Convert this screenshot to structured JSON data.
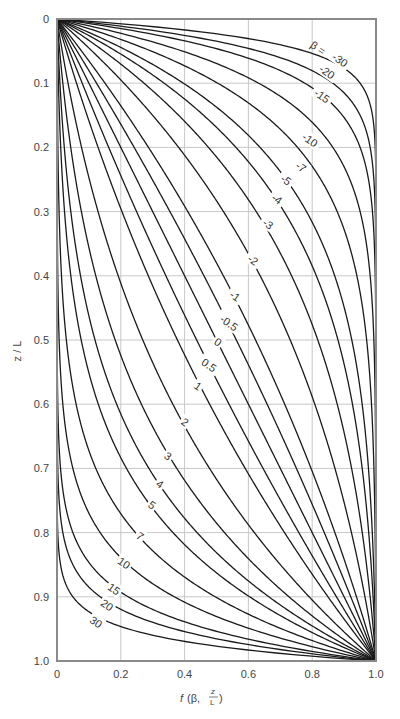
{
  "chart_data": {
    "type": "line",
    "title": "",
    "xlabel": "f (β, z/L)",
    "ylabel": "z / L",
    "xlim": [
      0,
      1.0
    ],
    "ylim": [
      1.0,
      0
    ],
    "y_inverted": true,
    "grid": true,
    "legend": "inline curve labels",
    "x_ticks": [
      "0",
      "0.2",
      "0.4",
      "0.6",
      "0.8",
      "1.0"
    ],
    "y_ticks": [
      "0",
      "0.1",
      "0.2",
      "0.3",
      "0.4",
      "0.5",
      "0.6",
      "0.7",
      "0.8",
      "0.9",
      "1.0"
    ],
    "curve_family": "f = (exp(β·z/L) − 1) / (exp(β) − 1)",
    "label_prefix": "β = ",
    "series": [
      {
        "name": "-30",
        "beta": -30,
        "label_pos": [
          340,
          60
        ]
      },
      {
        "name": "-20",
        "beta": -20,
        "label_pos": [
          327,
          72
        ]
      },
      {
        "name": "-15",
        "beta": -15,
        "label_pos": [
          322,
          96
        ]
      },
      {
        "name": "-10",
        "beta": -10,
        "label_pos": [
          310,
          140
        ]
      },
      {
        "name": "-7",
        "beta": -7,
        "label_pos": [
          301,
          167
        ]
      },
      {
        "name": "-5",
        "beta": -5,
        "label_pos": [
          286,
          180
        ]
      },
      {
        "name": "-4",
        "beta": -4,
        "label_pos": [
          277,
          199
        ]
      },
      {
        "name": "-3",
        "beta": -3,
        "label_pos": [
          268,
          224
        ]
      },
      {
        "name": "-2",
        "beta": -2,
        "label_pos": [
          253,
          260
        ]
      },
      {
        "name": "-1",
        "beta": -1,
        "label_pos": [
          235,
          296
        ]
      },
      {
        "name": "-0.5",
        "beta": -0.5,
        "label_pos": [
          229,
          323
        ]
      },
      {
        "name": "0",
        "beta": 0,
        "label_pos": [
          218,
          342
        ]
      },
      {
        "name": "0.5",
        "beta": 0.5,
        "label_pos": [
          209,
          365
        ]
      },
      {
        "name": "1",
        "beta": 1,
        "label_pos": [
          198,
          386
        ]
      },
      {
        "name": "2",
        "beta": 2,
        "label_pos": [
          185,
          422
        ]
      },
      {
        "name": "3",
        "beta": 3,
        "label_pos": [
          168,
          456
        ]
      },
      {
        "name": "4",
        "beta": 4,
        "label_pos": [
          160,
          484
        ]
      },
      {
        "name": "5",
        "beta": 5,
        "label_pos": [
          152,
          505
        ]
      },
      {
        "name": "7",
        "beta": 7,
        "label_pos": [
          140,
          536
        ]
      },
      {
        "name": "10",
        "beta": 10,
        "label_pos": [
          124,
          563
        ]
      },
      {
        "name": "15",
        "beta": 15,
        "label_pos": [
          114,
          589
        ]
      },
      {
        "name": "20",
        "beta": 20,
        "label_pos": [
          107,
          605
        ]
      },
      {
        "name": "30",
        "beta": 30,
        "label_pos": [
          96,
          622
        ]
      }
    ]
  },
  "axes": {
    "xlabel_f": "f",
    "xlabel_args": "(β,",
    "xlabel_frac_num": "z",
    "xlabel_frac_den": "L",
    "xlabel_close": ")",
    "ylabel": "z / L",
    "beta_prefix": "β = "
  },
  "colors": {
    "curve": "#1a1a1a",
    "grid": "#c8c8c8",
    "frame": "#8a8a8a",
    "text": "#444444"
  }
}
